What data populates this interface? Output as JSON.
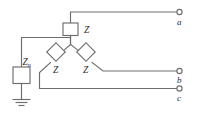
{
  "diagram": {
    "type": "electrical-schematic",
    "colors": {
      "wire": "#6e6e70",
      "component_fill": "#ffffff",
      "label": "#2b2b2b",
      "background": "#ffffff"
    },
    "components": [
      {
        "id": "z-phase-a",
        "shape": "square",
        "orientation": "upright",
        "label": "Z",
        "label_position": "right",
        "connects": [
          "neutral-node",
          "terminal-a"
        ]
      },
      {
        "id": "z-phase-c",
        "shape": "diamond",
        "orientation": "rotated-45",
        "label": "Z",
        "label_position": "below",
        "connects": [
          "neutral-node",
          "terminal-c"
        ]
      },
      {
        "id": "z-phase-b",
        "shape": "diamond",
        "orientation": "rotated-45",
        "label": "Z",
        "label_position": "below",
        "connects": [
          "neutral-node",
          "terminal-b"
        ]
      },
      {
        "id": "z-neutral",
        "shape": "rectangle",
        "orientation": "vertical",
        "label": "Z",
        "label_subscript": "n",
        "label_position": "upper-right",
        "connects": [
          "neutral-node",
          "ground"
        ]
      }
    ],
    "terminals": [
      {
        "id": "terminal-a",
        "label": "a",
        "marker": "open-circle"
      },
      {
        "id": "terminal-b",
        "label": "b",
        "marker": "open-circle"
      },
      {
        "id": "terminal-c",
        "label": "c",
        "marker": "open-circle"
      }
    ],
    "ground": {
      "id": "ground-symbol",
      "type": "earth-ground",
      "bars": 3
    },
    "labels": {
      "z_a": "Z",
      "z_b": "Z",
      "z_c": "Z",
      "z_n_main": "Z",
      "z_n_sub": "n",
      "terminal_a": "a",
      "terminal_b": "b",
      "terminal_c": "c"
    }
  }
}
